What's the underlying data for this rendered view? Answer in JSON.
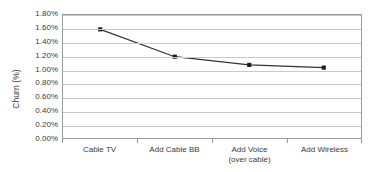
{
  "chart_data": {
    "type": "line",
    "title": "",
    "subtitle": "",
    "xlabel": "",
    "ylabel": "Churn (%)",
    "categories": [
      "Cable TV",
      "Add Cable BB",
      "Add Voice (over cable)",
      "Add Wireless"
    ],
    "category_lines": [
      [
        "Cable TV"
      ],
      [
        "Add Cable BB"
      ],
      [
        "Add Voice",
        "(over cable)"
      ],
      [
        "Add Wireless"
      ]
    ],
    "values": [
      1.59,
      1.19,
      1.07,
      1.03
    ],
    "value_labels": [
      "1.59%",
      "1.19%",
      "1.07%",
      "1.03%"
    ],
    "series": [
      {
        "name": "Churn",
        "values": [
          1.59,
          1.19,
          1.07,
          1.03
        ]
      }
    ],
    "ylim": [
      0.0,
      1.8
    ],
    "ytick_values": [
      1.8,
      1.6,
      1.4,
      1.2,
      1.0,
      0.8,
      0.6,
      0.4,
      0.2,
      0.0
    ],
    "ytick_labels": [
      "1.80%",
      "1.60%",
      "1.40%",
      "1.20%",
      "1.00%",
      "0.80%",
      "0.60%",
      "0.40%",
      "0.20%",
      "0.00%"
    ],
    "grid": true,
    "grid_axis": "y",
    "legend": false,
    "legend_position": "none",
    "marker": "square",
    "colors": {
      "line": "#333333",
      "marker": "#1a1a1a",
      "gridline": "#c9c9c9",
      "axis_border": "#9a9a9a",
      "text": "#3a3a3a",
      "background": "#ffffff"
    }
  }
}
